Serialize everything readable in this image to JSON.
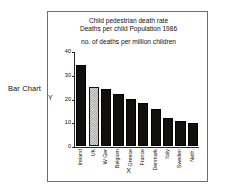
{
  "side_caption": "Bar Chart",
  "chart_data": {
    "type": "bar",
    "title": "Child pedestrian death rate",
    "title_line1": "Child pedestrian death rate",
    "title_line2": "Deaths per child Population 1986",
    "subtitle": "no. of deaths per million children",
    "xlabel": "X",
    "ylabel": "Y",
    "ylim": [
      0,
      40
    ],
    "yticks": [
      0,
      10,
      20,
      30,
      40
    ],
    "grid": false,
    "legend": "none",
    "categories": [
      "Ireland",
      "UK",
      "W Ger",
      "Belgium",
      "Greece",
      "France",
      "Denmark",
      "Italy",
      "Sweden",
      "Neth."
    ],
    "values": [
      34,
      25,
      24,
      22,
      20,
      18,
      15.5,
      12,
      10.5,
      9.5
    ],
    "bar_styles": [
      "solid",
      "hatched",
      "solid",
      "solid",
      "solid",
      "solid",
      "solid",
      "solid",
      "solid",
      "solid"
    ],
    "colors": {
      "bar_solid": "#120f0f",
      "bar_hatched": "#e3e3e3",
      "axis": "#2a2a2a",
      "frame": "#6e6e6e",
      "text": "#111111",
      "background": "#ffffff"
    }
  }
}
